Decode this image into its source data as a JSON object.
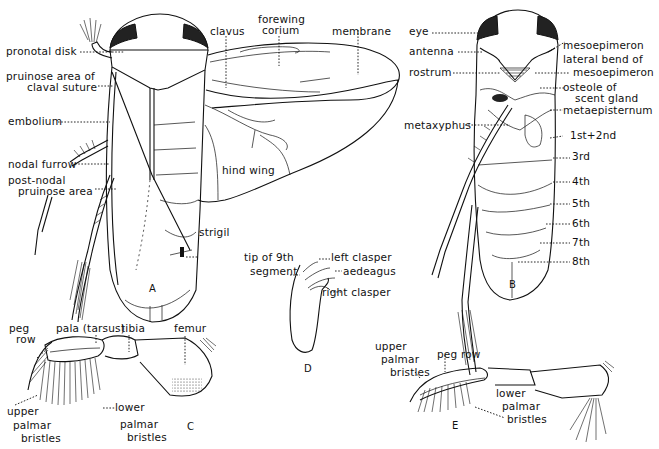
{
  "figure": {
    "panels": {
      "A": {
        "letter": "A",
        "description": "dorsal view with wings spread",
        "labels": {
          "pronotal_disk": "pronotal disk",
          "pruinose_area_line1": "pruinose area of",
          "pruinose_area_line2": "claval suture",
          "embolium": "embolium",
          "nodal_furrow": "nodal furrow",
          "post_nodal_line1": "post-nodal",
          "post_nodal_line2": "pruinose area",
          "clavus": "clavus",
          "forewing_line1": "forewing",
          "forewing_line2": "corium",
          "membrane": "membrane",
          "hind_wing": "hind wing",
          "strigil": "strigil"
        }
      },
      "B": {
        "letter": "B",
        "description": "ventral view",
        "labels": {
          "eye": "eye",
          "antenna": "antenna",
          "rostrum": "rostrum",
          "metaxyphus": "metaxyphus",
          "mesoepimeron": "mesoepimeron",
          "lateral_bend_line1": "lateral bend of",
          "lateral_bend_line2": "mesoepimeron",
          "osteole_line1": "osteole of",
          "osteole_line2": "scent gland",
          "metaepisternum": "metaepisternum",
          "seg_1_2": "1st+2nd",
          "seg_3": "3rd",
          "seg_4": "4th",
          "seg_5": "5th",
          "seg_6": "6th",
          "seg_7": "7th",
          "seg_8": "8th"
        }
      },
      "C": {
        "letter": "C",
        "description": "front leg, male",
        "labels": {
          "peg_line1": "peg",
          "peg_line2": "row",
          "pala": "pala (tarsus)",
          "tibia": "tibia",
          "femur": "femur",
          "upper_line1": "upper",
          "upper_line2": "palmar",
          "upper_line3": "bristles",
          "lower_line1": "lower",
          "lower_line2": "palmar",
          "lower_line3": "bristles"
        }
      },
      "D": {
        "letter": "D",
        "description": "male genitalia",
        "labels": {
          "tip_line1": "tip of 9th",
          "tip_line2": "segment",
          "left_clasper": "left clasper",
          "aedeagus": "aedeagus",
          "right_clasper": "right clasper"
        }
      },
      "E": {
        "letter": "E",
        "description": "front leg, second form",
        "labels": {
          "upper_line1": "upper",
          "upper_line2": "palmar",
          "upper_line3": "bristles",
          "peg_row": "peg row",
          "lower_line1": "lower",
          "lower_line2": "palmar",
          "lower_line3": "bristles"
        }
      }
    },
    "colors": {
      "ink": "#111111",
      "paper": "#ffffff"
    }
  }
}
